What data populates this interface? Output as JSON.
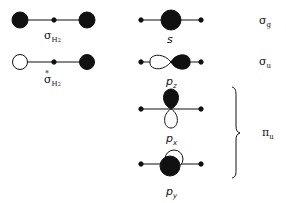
{
  "diagram": {
    "left_column": {
      "bonding": {
        "label": "σ",
        "subscript": "H",
        "subscript2": "2"
      },
      "antibonding": {
        "label": "σ",
        "star": "*",
        "subscript": "H",
        "subscript2": "2"
      }
    },
    "center_column": {
      "s": {
        "label": "s"
      },
      "pz": {
        "label": "p",
        "subscript": "z"
      },
      "px": {
        "label": "p",
        "subscript": "x"
      },
      "py": {
        "label": "p",
        "subscript": "y"
      }
    },
    "right_column": {
      "sigma_g": {
        "label": "σ",
        "subscript": "g"
      },
      "sigma_u": {
        "label": "σ",
        "subscript": "u"
      },
      "pi_u": {
        "label": "π",
        "subscript": "u"
      }
    },
    "colors": {
      "ink": "#111111",
      "background": "#ffffff"
    }
  }
}
